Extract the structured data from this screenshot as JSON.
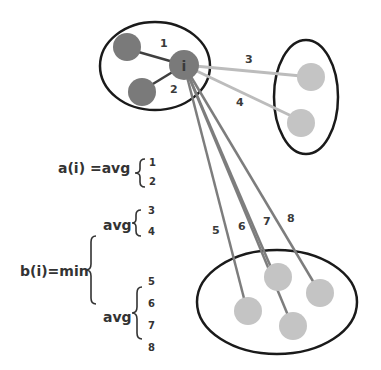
{
  "diagram": {
    "point_label": "i",
    "colors": {
      "own_cluster_point": "#7a7a7a",
      "other_cluster_point": "#c4c4c4",
      "edge_own": "#3f3f3f",
      "edge_cluster2": "#bcbcbc",
      "edge_cluster3": "#7d7d7d",
      "cluster_outline": "#1a1a1a"
    },
    "edge_labels": [
      "1",
      "2",
      "3",
      "4",
      "5",
      "6",
      "7",
      "8"
    ],
    "formula_a": {
      "lhs": "a(i) =avg",
      "terms": [
        "1",
        "2"
      ]
    },
    "formula_b": {
      "lhs": "b(i)=min",
      "group1": {
        "op": "avg",
        "terms": [
          "3",
          "4"
        ]
      },
      "group2": {
        "op": "avg",
        "terms": [
          "5",
          "6",
          "7",
          "8"
        ]
      }
    }
  }
}
